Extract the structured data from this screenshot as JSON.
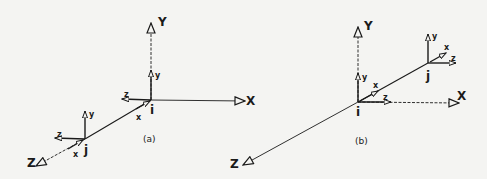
{
  "figures": [
    {
      "caption": "(a)",
      "global_axes": {
        "x": "X",
        "y": "Y",
        "z": "Z"
      },
      "nodes": [
        {
          "name": "i",
          "local_axes": {
            "x": "x",
            "y": "y",
            "z": "z"
          }
        },
        {
          "name": "j",
          "local_axes": {
            "x": "x",
            "y": "y",
            "z": "z"
          }
        }
      ]
    },
    {
      "caption": "(b)",
      "global_axes": {
        "x": "X",
        "y": "Y",
        "z": "Z"
      },
      "nodes": [
        {
          "name": "i",
          "local_axes": {
            "x": "x",
            "y": "y",
            "z": "z"
          }
        },
        {
          "name": "j",
          "local_axes": {
            "x": "x",
            "y": "y",
            "z": "z"
          }
        }
      ]
    }
  ],
  "colors": {
    "ink": "#1a1a1a",
    "paper": "#f4f4f2"
  }
}
